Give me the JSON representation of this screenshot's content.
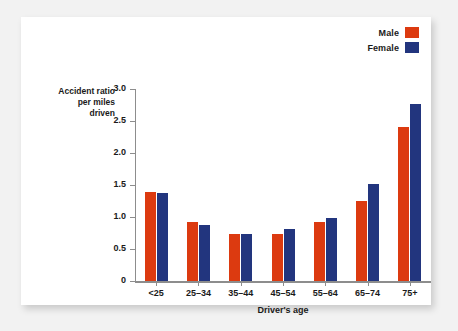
{
  "chart_data": {
    "type": "bar",
    "title": "",
    "xlabel": "Driver's age",
    "ylabel": "Accident ratio\nper miles\ndriven",
    "ylabel_lines": [
      "Accident ratio",
      "per miles",
      "driven"
    ],
    "categories": [
      "<25",
      "25–34",
      "35–44",
      "45–54",
      "55–64",
      "65–74",
      "75+"
    ],
    "series": [
      {
        "name": "Male",
        "color": "#dc3a10",
        "values": [
          1.39,
          0.92,
          0.74,
          0.74,
          0.92,
          1.25,
          2.4
        ]
      },
      {
        "name": "Female",
        "color": "#22357e",
        "values": [
          1.37,
          0.88,
          0.74,
          0.82,
          0.98,
          1.51,
          2.77
        ]
      }
    ],
    "ylim": [
      0,
      3.0
    ],
    "yticks": [
      0,
      0.5,
      1.0,
      1.5,
      2.0,
      2.5,
      3.0
    ],
    "ytick_labels": [
      "0",
      "0.5",
      "1.0",
      "1.5",
      "2.0",
      "2.5",
      "3.0"
    ],
    "grid": false,
    "legend_position": "top-right"
  },
  "legend": {
    "items": [
      {
        "label": "Male",
        "color": "#dc3a10",
        "swatch_name": "legend-swatch-male"
      },
      {
        "label": "Female",
        "color": "#22357e",
        "swatch_name": "legend-swatch-female"
      }
    ]
  },
  "colors": {
    "male": "#dc3a10",
    "female": "#22357e",
    "axis": "#8d8d8d",
    "text": "#1a1a1a",
    "card": "#ffffff",
    "page_background": "#f2f2f2"
  }
}
